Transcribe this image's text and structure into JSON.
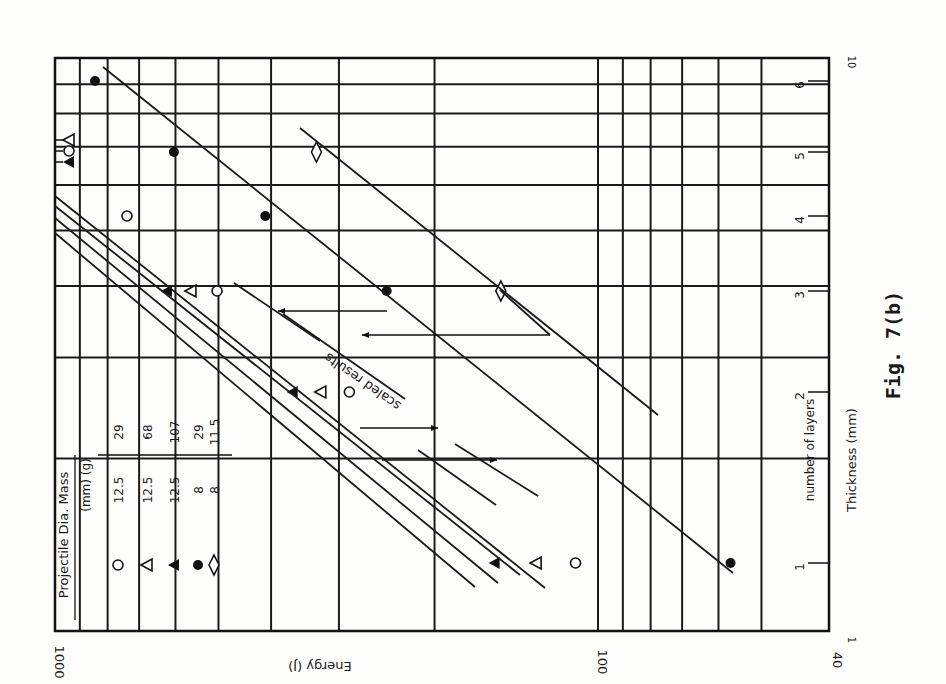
{
  "figure_label": "Fig. 7(b)",
  "chart_data": {
    "type": "scatter",
    "orientation_note": "plot printed rotated 90 degrees clockwise",
    "title": "",
    "xlabel": "Thickness (mm)",
    "x_secondary_label": "number of layers",
    "ylabel": "Energy (J)",
    "x_scale": "log",
    "y_scale": "log",
    "xlim": [
      1,
      10
    ],
    "ylim": [
      40,
      1000
    ],
    "x_tick_labels": [
      "1",
      "10"
    ],
    "y_tick_labels": [
      "1000",
      "100",
      "40"
    ],
    "layer_tick_labels": [
      "1",
      "2",
      "3",
      "4",
      "5",
      "6"
    ],
    "grid": true,
    "legend": {
      "headers": [
        "Projectile",
        "Dia.",
        "Mass"
      ],
      "units": [
        "",
        "(mm)",
        "(g)"
      ],
      "entries": [
        {
          "marker": "open-circle",
          "dia": "12.5",
          "mass": "29"
        },
        {
          "marker": "open-triangle",
          "dia": "12.5",
          "mass": "68"
        },
        {
          "marker": "filled-triangle",
          "dia": "12.5",
          "mass": "107"
        },
        {
          "marker": "filled-circle",
          "dia": "8",
          "mass": "29"
        },
        {
          "marker": "diamond",
          "dia": "8",
          "mass": "11.5"
        }
      ]
    },
    "annotation": "scaled results",
    "series": [
      {
        "name": "12.5 mm / 29 g",
        "marker": "open-circle",
        "layers": [
          1,
          2,
          3,
          4
        ],
        "energy_J": [
          110,
          287,
          503,
          737
        ]
      },
      {
        "name": "12.5 mm / 68 g",
        "marker": "open-triangle",
        "layers": [
          1,
          2,
          3
        ],
        "energy_J": [
          130,
          324,
          562
        ]
      },
      {
        "name": "12.5 mm / 107 g",
        "marker": "filled-triangle",
        "layers": [
          1,
          2,
          3
        ],
        "energy_J": [
          155,
          365,
          622
        ]
      },
      {
        "name": "8 mm / 29 g",
        "marker": "filled-circle",
        "layers": [
          1,
          3,
          4,
          5,
          6
        ],
        "energy_J": [
          57,
          245,
          410,
          604,
          844
        ]
      },
      {
        "name": "8 mm / 11.5 g",
        "marker": "diamond",
        "layers": [
          3,
          5
        ],
        "energy_J": [
          151,
          330
        ]
      }
    ],
    "off_scale_markers": [
      "open-triangle",
      "open-circle",
      "filled-triangle"
    ]
  }
}
